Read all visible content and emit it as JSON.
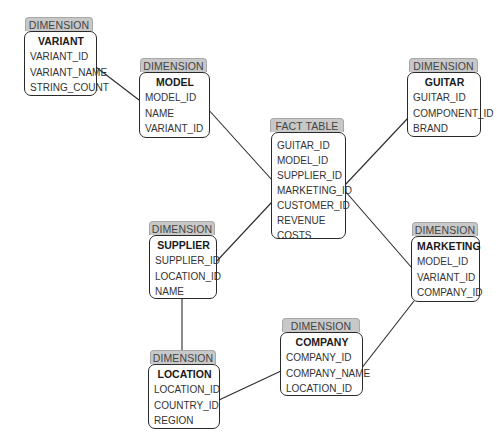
{
  "diagram": {
    "type": "star-schema",
    "tab_color": "#c8c8c8",
    "line_color": "#2b2b2b"
  },
  "entities": {
    "variant": {
      "tab": "DIMENSION",
      "title": "VARIANT",
      "fields": [
        "VARIANT_ID",
        "VARIANT_NAME",
        "STRING_COUNT"
      ]
    },
    "model": {
      "tab": "DIMENSION",
      "title": "MODEL",
      "fields": [
        "MODEL_ID",
        "NAME",
        "VARIANT_ID"
      ]
    },
    "fact": {
      "tab": "FACT TABLE",
      "fields": [
        "GUITAR_ID",
        "MODEL_ID",
        "SUPPLIER_ID",
        "MARKETING_ID",
        "CUSTOMER_ID",
        "REVENUE",
        "COSTS"
      ]
    },
    "guitar": {
      "tab": "DIMENSION",
      "title": "GUITAR",
      "fields": [
        "GUITAR_ID",
        "COMPONENT_ID",
        "BRAND"
      ]
    },
    "marketing": {
      "tab": "DIMENSION",
      "title": "MARKETING",
      "fields": [
        "MODEL_ID",
        "VARIANT_ID",
        "COMPANY_ID"
      ]
    },
    "supplier": {
      "tab": "DIMENSION",
      "title": "SUPPLIER",
      "fields": [
        "SUPPLIER_ID",
        "LOCATION_ID",
        "NAME"
      ]
    },
    "location": {
      "tab": "DIMENSION",
      "title": "LOCATION",
      "fields": [
        "LOCATION_ID",
        "COUNTRY_ID",
        "REGION"
      ]
    },
    "company": {
      "tab": "DIMENSION",
      "title": "COMPANY",
      "fields": [
        "COMPANY_ID",
        "COMPANY_NAME",
        "LOCATION_ID"
      ]
    }
  },
  "relationships": [
    {
      "from": "variant",
      "to": "model"
    },
    {
      "from": "model",
      "to": "fact"
    },
    {
      "from": "guitar",
      "to": "fact"
    },
    {
      "from": "fact",
      "to": "marketing"
    },
    {
      "from": "supplier",
      "to": "fact"
    },
    {
      "from": "supplier",
      "to": "location"
    },
    {
      "from": "location",
      "to": "company"
    },
    {
      "from": "company",
      "to": "marketing"
    }
  ]
}
